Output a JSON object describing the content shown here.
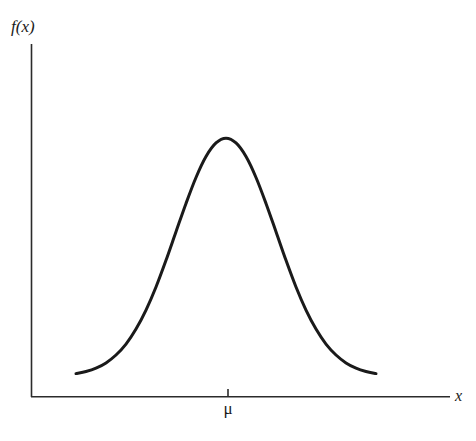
{
  "figure": {
    "background_color": "#ffffff",
    "axis_color": "#2b2b2b",
    "curve_color": "#1a1a1a",
    "ylabel": "f(x)",
    "xlabel": "x",
    "tick_label": "μ"
  },
  "chart_data": {
    "type": "line",
    "title": "",
    "subtitle": "",
    "xlabel": "x",
    "ylabel": "f(x)",
    "legend": [],
    "legend_position": "none",
    "grid": false,
    "annotations": [
      {
        "text": "μ",
        "axis": "x",
        "x": 0,
        "description": "tick mark on x-axis at the mean, directly below the peak of the density"
      }
    ],
    "axis_ticks": {
      "x": [
        "μ"
      ],
      "y": []
    },
    "xlim": [
      -3.0,
      3.0
    ],
    "ylim": [
      0.0,
      1.05
    ],
    "distribution": {
      "name": "normal",
      "mean": 0,
      "sigma": 1,
      "peak_value": 1.0
    },
    "series": [
      {
        "name": "f(x)",
        "color": "#1a1a1a",
        "linewidth": 3,
        "x": [
          -3.0,
          -2.8,
          -2.6,
          -2.4,
          -2.2,
          -2.0,
          -1.8,
          -1.6,
          -1.4,
          -1.2,
          -1.0,
          -0.8,
          -0.6,
          -0.4,
          -0.2,
          0.0,
          0.2,
          0.4,
          0.6,
          0.8,
          1.0,
          1.2,
          1.4,
          1.6,
          1.8,
          2.0,
          2.2,
          2.4,
          2.6,
          2.8,
          3.0
        ],
        "values": [
          0.011,
          0.02,
          0.034,
          0.056,
          0.089,
          0.135,
          0.198,
          0.278,
          0.375,
          0.487,
          0.607,
          0.726,
          0.835,
          0.923,
          0.98,
          1.0,
          0.98,
          0.923,
          0.835,
          0.726,
          0.607,
          0.487,
          0.375,
          0.278,
          0.198,
          0.135,
          0.089,
          0.056,
          0.034,
          0.02,
          0.011
        ]
      }
    ]
  }
}
